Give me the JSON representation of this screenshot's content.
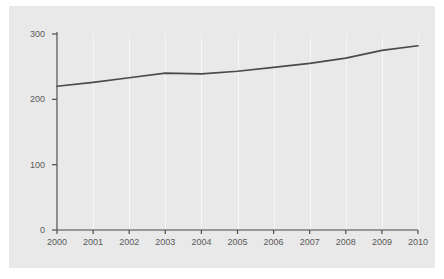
{
  "chart_data": {
    "type": "line",
    "title": "",
    "subtitle": "",
    "xlabel": "",
    "ylabel": "",
    "categories": [
      "2000",
      "2001",
      "2002",
      "2003",
      "2004",
      "2005",
      "2006",
      "2007",
      "2008",
      "2009",
      "2010"
    ],
    "x": [
      2000,
      2001,
      2002,
      2003,
      2004,
      2005,
      2006,
      2007,
      2008,
      2009,
      2010
    ],
    "series": [
      {
        "name": "",
        "values": [
          220,
          226,
          233,
          240,
          239,
          243,
          249,
          255,
          263,
          275,
          282
        ]
      }
    ],
    "xlim": [
      2000,
      2010
    ],
    "ylim": [
      0,
      300
    ],
    "yticks": [
      0,
      100,
      200,
      300
    ],
    "ytick_labels": [
      "0",
      "100",
      "200",
      "300"
    ],
    "xticks": [
      2000,
      2001,
      2002,
      2003,
      2004,
      2005,
      2006,
      2007,
      2008,
      2009,
      2010
    ],
    "xtick_labels": [
      "2000",
      "2001",
      "2002",
      "2003",
      "2004",
      "2005",
      "2006",
      "2007",
      "2008",
      "2009",
      "2010"
    ],
    "grid": {
      "vertical": true,
      "horizontal": false
    },
    "legend": {
      "visible": false,
      "position": "none"
    },
    "colors": {
      "figure_background": "#ffffff",
      "panel_background": "#e9e9e9",
      "gridline": "#f6f6f6",
      "axis": "#4d4d4d",
      "line": "#4a4a4a",
      "tick_text": "#5a5a5a"
    }
  }
}
